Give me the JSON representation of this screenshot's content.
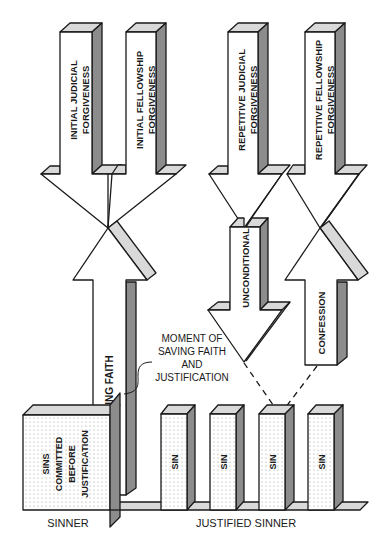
{
  "diagram": {
    "type": "forgiveness-flow-diagram",
    "colors": {
      "stroke": "#1a1a1a",
      "face": "#ffffff",
      "top_shade": "#d9d9d9",
      "side_shade": "#8c8c8c",
      "dot_fill": "#b0b0b0"
    },
    "arrows": {
      "initial_judicial": {
        "label_line1": "INITIAL JUDICIAL",
        "label_line2": "FORGIVENESS",
        "direction": "down"
      },
      "initial_fellowship": {
        "label_line1": "INITIAL FELLOWSHIP",
        "label_line2": "FORGIVENESS",
        "direction": "down"
      },
      "repetitive_judicial": {
        "label_line1": "REPETITIVE JUDICIAL",
        "label_line2": "FORGIVENESS",
        "direction": "down"
      },
      "repetitive_fellowship": {
        "label_line1": "REPETITIVE FELLOWSHIP",
        "label_line2": "FORGIVENESS",
        "direction": "down"
      },
      "saving_faith": {
        "label": "SAVING FAITH",
        "direction": "up"
      },
      "unconditional": {
        "label": "UNCONDITIONAL",
        "direction": "down"
      },
      "confession": {
        "label": "CONFESSION",
        "direction": "up"
      }
    },
    "callout": {
      "line1": "MOMENT OF",
      "line2": "SAVING FAITH",
      "line3": "AND",
      "line4": "JUSTIFICATION"
    },
    "blocks": {
      "sinner_block": {
        "line1": "SINS",
        "line2": "COMMITTED",
        "line3": "BEFORE",
        "line4": "JUSTIFICATION"
      },
      "sin_blocks": [
        {
          "label": "SIN"
        },
        {
          "label": "SIN"
        },
        {
          "label": "SIN"
        },
        {
          "label": "SIN"
        }
      ]
    },
    "captions": {
      "sinner": "SINNER",
      "justified_sinner": "JUSTIFIED SINNER"
    }
  }
}
